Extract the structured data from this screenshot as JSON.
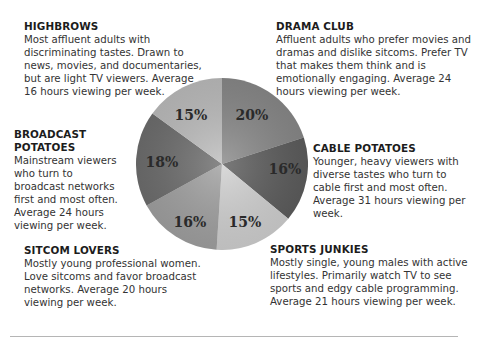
{
  "segments": {
    "highbrows": {
      "title": "HIGHBROWS",
      "desc": "Most affluent adults with discriminating tastes. Drawn to news, movies, and documentaries, but are light TV viewers. Average 16 hours viewing per week."
    },
    "drama_club": {
      "title": "DRAMA CLUB",
      "desc": "Affluent adults who prefer movies and dramas and dislike sitcoms. Prefer TV that makes them think and is emotionally engaging. Average 24 hours viewing per week."
    },
    "broadcast_potatoes": {
      "title": "BROADCAST POTATOES",
      "desc": "Mainstream viewers who turn to broadcast networks first and most often. Average 24 hours viewing per week."
    },
    "cable_potatoes": {
      "title": "CABLE POTATOES",
      "desc": "Younger, heavy viewers with diverse tastes who turn to cable first and most often. Average 31 hours viewing per week."
    },
    "sitcom_lovers": {
      "title": "SITCOM LOVERS",
      "desc": "Mostly young professional women. Love sitcoms and favor broadcast networks. Average 20 hours viewing per week."
    },
    "sports_junkies": {
      "title": "SPORTS JUNKIES",
      "desc": "Mostly single, young males with active lifestyles. Primarily watch TV to see sports and edgy cable programming. Average 21 hours viewing per week."
    }
  },
  "labels": {
    "drama_club": "20%",
    "cable_potatoes": "16%",
    "sports_junkies": "15%",
    "sitcom_lovers": "16%",
    "broadcast_potatoes": "18%",
    "highbrows": "15%"
  },
  "chart_data": {
    "type": "pie",
    "title": "",
    "categories": [
      "Drama Club",
      "Cable Potatoes",
      "Sports Junkies",
      "Sitcom Lovers",
      "Broadcast Potatoes",
      "Highbrows"
    ],
    "values": [
      20,
      16,
      15,
      16,
      18,
      15
    ],
    "colors": [
      "#8a8a8a",
      "#5e5e5e",
      "#d2d2d2",
      "#a2a2a2",
      "#6f6f6f",
      "#bebebe"
    ],
    "avg_hours_per_week": [
      24,
      31,
      21,
      20,
      24,
      16
    ],
    "legend": "none (callout text blocks around pie)"
  }
}
